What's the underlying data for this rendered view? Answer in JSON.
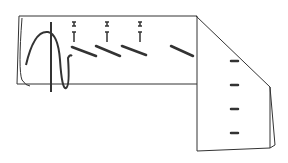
{
  "figure": {
    "type": "line-drawing",
    "stroke_color": "#333333",
    "background": "#ffffff",
    "pins_count": 3,
    "diagonal_stitches_count": 4,
    "right_panel_marks_count": 4
  }
}
